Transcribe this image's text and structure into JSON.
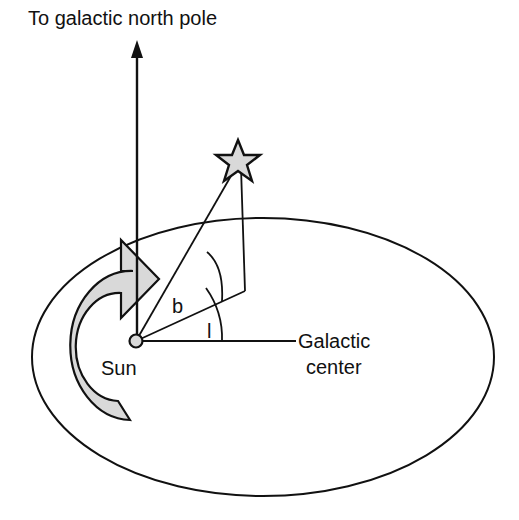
{
  "figure": {
    "type": "diagram",
    "background_color": "#ffffff",
    "line_color": "#111111",
    "fill_gray": "#d9d9d9"
  },
  "labels": {
    "north_pole": "To galactic north pole",
    "sun": "Sun",
    "galactic_center_line1": "Galactic",
    "galactic_center_line2": "center",
    "latitude": "b",
    "longitude": "l"
  },
  "geometry": {
    "galactic_plane_ellipse": {
      "cx": 263,
      "cy": 357,
      "rx": 231,
      "ry": 139
    },
    "sun_position": {
      "x": 136,
      "y": 341,
      "r": 6
    },
    "star_position": {
      "x": 238,
      "y": 158
    },
    "projection_point": {
      "x": 244,
      "y": 291
    },
    "north_pole_arrow_tip": {
      "x": 137,
      "y": 42
    },
    "galactic_center_line_end": {
      "x": 296,
      "y": 341
    },
    "rotation_arrow": "counterclockwise-galactic-rotation"
  },
  "elements": {
    "star_icon": "star-icon",
    "sun_marker": "sun-marker",
    "north_pole_axis": "north-pole-axis",
    "rotation_arrow_icon": "rotation-arrow-icon",
    "latitude_arc": "latitude-arc",
    "longitude_arc": "longitude-arc"
  }
}
